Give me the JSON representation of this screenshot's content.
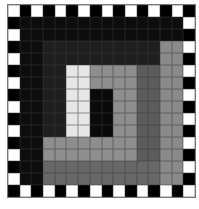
{
  "board": {
    "rows": 16,
    "cols": 16,
    "palette": {
      "W": "#ffffff",
      "B": "#000000",
      "K": "#0d0d0d",
      "D": "#1f1f1f",
      "L": "#e6e6e6",
      "G": "#8e8e8e",
      "M": "#5c5c5c",
      "N": "#686868",
      "H": "#8a8a8a",
      "C": "#0a0a0a"
    },
    "grid": [
      "WBWBWBWBWBWBWBWB",
      "BKKKKKKKKKKKKKKW",
      "WKKKKKKKKKKKKKKB",
      "BKKDDDDDDDDDDHHW",
      "WKKDDDDDDDDDDHHB",
      "BKKDDLLGGGGMMHHW",
      "WKKDDLLGGGGMMHHB",
      "BKKDDLLCCGGMMHHW",
      "WKKDDLLCCGGMMHHB",
      "BKKDDLLCCGGMMHHW",
      "WKKDDLLCCGGMMHHB",
      "BKKGGGGGGGGMMHHW",
      "WKKGGGGGGGGMMHHB",
      "BKKNNNNNNNNNNHHW",
      "WKKNNNNNNNNNNHHB",
      "BWBWBWBWBWBWBWBW"
    ]
  }
}
